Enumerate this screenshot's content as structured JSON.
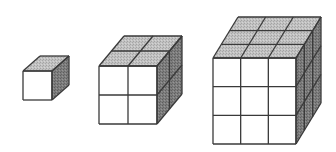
{
  "diagram": {
    "colors": {
      "front": "#ffffff",
      "top": "#bdbdbd",
      "side": "#7a7a7a",
      "stroke": "#3a3a3a",
      "background": "#ffffff"
    },
    "cubes": [
      {
        "id": "cube-1",
        "n": 1,
        "x": 23,
        "y": 71,
        "size": 29,
        "dx": 17,
        "dy": -15
      },
      {
        "id": "cube-2",
        "n": 2,
        "x": 99,
        "y": 66,
        "size": 58,
        "dx": 25,
        "dy": -30
      },
      {
        "id": "cube-3",
        "n": 3,
        "x": 213,
        "y": 58,
        "size": 83,
        "w": 83,
        "h": 86,
        "dx": 25,
        "dy": -41
      }
    ]
  }
}
